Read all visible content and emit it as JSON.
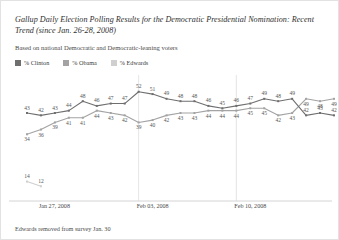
{
  "title": "Gallup Daily Election Polling Results for the Democratic Presidential Nomination: Recent Trend (since Jan. 26-28, 2008)",
  "subtitle": "Based on national Democratic and Democratic-leaning voters",
  "footnote": "Edwards removed from survey Jan. 30",
  "legend": {
    "position": "top-left",
    "items": [
      {
        "label": "% Clinton",
        "color": "#6f6f6f"
      },
      {
        "label": "% Obama",
        "color": "#a3a3a3"
      },
      {
        "label": "% Edwards",
        "color": "#cfcfcf"
      }
    ]
  },
  "chart_data": {
    "type": "line",
    "title": "Gallup Daily Election Polling Results for the Democratic Presidential Nomination: Recent Trend (since Jan. 26-28, 2008)",
    "subtitle": "Based on national Democratic and Democratic-leaning voters",
    "xlabel": "",
    "ylabel": "",
    "ylim": [
      10,
      54
    ],
    "grid": false,
    "legend_position": "top-left",
    "x": [
      "Jan 26-28",
      "Jan 27-29",
      "Jan 28-30",
      "Jan 29-31",
      "Jan 30-Feb 1",
      "Jan 31-Feb 2",
      "Feb 1-3",
      "Feb 2-4",
      "Feb 3-5",
      "Feb 4-6",
      "Feb 5-7",
      "Feb 6-8",
      "Feb 7-9",
      "Feb 8-10",
      "Feb 9-11",
      "Feb 10-12",
      "Feb 11-13",
      "Feb 12-14",
      "Feb 13-15",
      "Feb 14-16",
      "Feb 15-17",
      "Feb 16-18",
      "Feb 17-19"
    ],
    "x_tick_labels": [
      "Jan 27, 2008",
      "Feb 03, 2008",
      "Feb 10, 2008"
    ],
    "x_tick_indices": [
      1,
      8,
      15
    ],
    "series": [
      {
        "name": "% Clinton",
        "color": "#6f6f6f",
        "values": [
          43,
          42,
          43,
          44,
          48,
          46,
          47,
          47,
          52,
          51,
          49,
          48,
          48,
          46,
          45,
          46,
          47,
          49,
          48,
          49,
          42,
          43,
          42
        ]
      },
      {
        "name": "% Obama",
        "color": "#a3a3a3",
        "values": [
          34,
          36,
          39,
          41,
          41,
          44,
          43,
          42,
          39,
          40,
          42,
          43,
          43,
          44,
          44,
          44,
          45,
          45,
          42,
          43,
          49,
          48,
          49
        ]
      },
      {
        "name": "% Edwards",
        "color": "#cfcfcf",
        "values": [
          14,
          12,
          null,
          null,
          null,
          null,
          null,
          null,
          null,
          null,
          null,
          null,
          null,
          null,
          null,
          null,
          null,
          null,
          null,
          null,
          null,
          null,
          null
        ]
      }
    ]
  }
}
